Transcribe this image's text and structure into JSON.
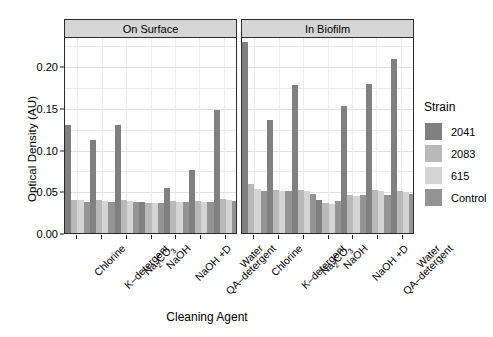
{
  "chart_data": {
    "type": "bar",
    "title": "",
    "xlabel": "Cleaning Agent",
    "ylabel": "Optical Density (AU)",
    "ylim": [
      0.0,
      0.235
    ],
    "yticks": [
      0.0,
      0.05,
      0.1,
      0.15,
      0.2
    ],
    "ytick_labels": [
      "0.00",
      "0.05",
      "0.10",
      "0.15",
      "0.20"
    ],
    "grid": true,
    "legend_position": "right",
    "legend_title": "Strain",
    "facets": [
      "On Surface",
      "In Biofilm"
    ],
    "categories": [
      "Chlorine",
      "K–detergent",
      "Na2CO3",
      "NaOH",
      "NaOH +D",
      "QA–detergent",
      "Water"
    ],
    "series": [
      {
        "name": "2041",
        "color": "#808080",
        "values_on_surface": [
          0.13,
          0.112,
          0.129,
          0.037,
          0.054,
          0.075,
          0.148
        ],
        "values_in_biofilm": [
          0.229,
          0.136,
          0.177,
          0.04,
          0.152,
          0.179,
          0.209
        ]
      },
      {
        "name": "2083",
        "color": "#b9b9b9",
        "values_on_surface": [
          0.04,
          0.039,
          0.039,
          0.036,
          0.038,
          0.038,
          0.041
        ],
        "values_in_biofilm": [
          0.059,
          0.051,
          0.052,
          0.036,
          0.045,
          0.051,
          0.05
        ]
      },
      {
        "name": "615",
        "color": "#d4d4d4",
        "values_on_surface": [
          0.039,
          0.038,
          0.038,
          0.036,
          0.037,
          0.037,
          0.04
        ],
        "values_in_biofilm": [
          0.053,
          0.05,
          0.05,
          0.035,
          0.044,
          0.05,
          0.049
        ]
      },
      {
        "name": "Control",
        "color": "#949494",
        "values_on_surface": [
          0.037,
          0.037,
          0.037,
          0.036,
          0.037,
          0.037,
          0.038
        ],
        "values_in_biofilm": [
          0.05,
          0.05,
          0.047,
          0.038,
          0.046,
          0.046,
          0.047
        ]
      }
    ]
  },
  "legend": {
    "title": "Strain",
    "items": [
      {
        "label": "2041",
        "color": "#808080"
      },
      {
        "label": "2083",
        "color": "#b9b9b9"
      },
      {
        "label": "615",
        "color": "#d4d4d4"
      },
      {
        "label": "Control",
        "color": "#949494"
      }
    ]
  },
  "axes": {
    "y_title": "Optical Density (AU)",
    "x_title": "Cleaning Agent"
  }
}
